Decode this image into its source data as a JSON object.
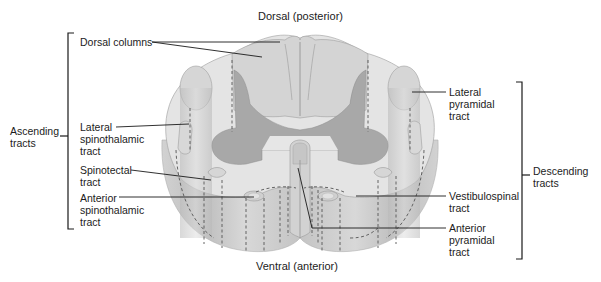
{
  "diagram": {
    "orientation": {
      "top": "Dorsal (posterior)",
      "bottom": "Ventral (anterior)"
    },
    "groups": {
      "ascending": "Ascending\ntracts",
      "descending": "Descending\ntracts"
    },
    "ascending_tracts": [
      {
        "label": "Dorsal columns"
      },
      {
        "label": "Lateral\nspinothalamic\ntract"
      },
      {
        "label": "Spinotectal\ntract"
      },
      {
        "label": "Anterior\nspinothalamic\ntract"
      }
    ],
    "descending_tracts": [
      {
        "label": "Lateral\npyramidal\ntract"
      },
      {
        "label": "Vestibulospinal\ntract"
      },
      {
        "label": "Anterior\npyramidal\ntract"
      }
    ],
    "colors": {
      "white_matter_outer": "#e6e6e6",
      "white_matter_side": "#c9c9c9",
      "gray_matter": "#a9a9a9",
      "tract_highlight": "#d6d6d6",
      "leader_line": "#1a1a1a"
    }
  }
}
